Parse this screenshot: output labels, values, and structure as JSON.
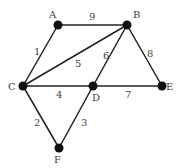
{
  "graph": {
    "nodes": [
      {
        "id": "A",
        "label": "A",
        "x": 58,
        "y": 25,
        "lx": 49,
        "ly": 18
      },
      {
        "id": "B",
        "label": "B",
        "x": 127,
        "y": 25,
        "lx": 133,
        "ly": 18
      },
      {
        "id": "C",
        "label": "C",
        "x": 23,
        "y": 86,
        "lx": 8,
        "ly": 90
      },
      {
        "id": "D",
        "label": "D",
        "x": 93,
        "y": 86,
        "lx": 92,
        "ly": 101
      },
      {
        "id": "E",
        "label": "E",
        "x": 162,
        "y": 86,
        "lx": 166,
        "ly": 90
      },
      {
        "id": "F",
        "label": "F",
        "x": 59,
        "y": 148,
        "lx": 54,
        "ly": 163
      }
    ],
    "edges": [
      {
        "from": "A",
        "to": "B",
        "weight": "9",
        "lx": 89,
        "ly": 20
      },
      {
        "from": "C",
        "to": "A",
        "weight": "1",
        "lx": 34,
        "ly": 55
      },
      {
        "from": "C",
        "to": "B",
        "weight": "5",
        "lx": 75,
        "ly": 67
      },
      {
        "from": "D",
        "to": "B",
        "weight": "6",
        "lx": 103,
        "ly": 59
      },
      {
        "from": "B",
        "to": "E",
        "weight": "8",
        "lx": 147,
        "ly": 57
      },
      {
        "from": "C",
        "to": "D",
        "weight": "4",
        "lx": 56,
        "ly": 98
      },
      {
        "from": "D",
        "to": "E",
        "weight": "7",
        "lx": 125,
        "ly": 98
      },
      {
        "from": "C",
        "to": "F",
        "weight": "2",
        "lx": 34,
        "ly": 126
      },
      {
        "from": "D",
        "to": "F",
        "weight": "3",
        "lx": 81,
        "ly": 126
      }
    ]
  }
}
